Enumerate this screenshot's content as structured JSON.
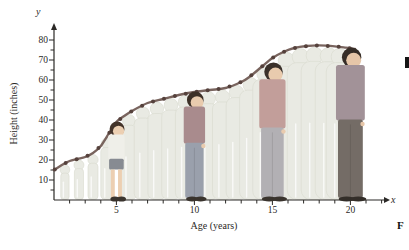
{
  "page": {
    "background": "#ffffff"
  },
  "chart_data": {
    "type": "line",
    "title": "",
    "xlabel": "Age (years)",
    "ylabel": "Height (inches)",
    "x_axis_letter": "x",
    "y_axis_letter": "y",
    "xlim": [
      1,
      22.5
    ],
    "ylim": [
      0,
      85
    ],
    "grid": false,
    "legend": "none",
    "x_ticks": {
      "labeled": [
        5,
        10,
        15,
        20
      ],
      "minor_step_years": 1,
      "minor_range": [
        2,
        22
      ]
    },
    "y_ticks": {
      "labeled": [
        10,
        20,
        30,
        40,
        50,
        60,
        70,
        80
      ],
      "minor_step_inches": 5
    },
    "series": [
      {
        "name": "height-vs-age",
        "x": [
          1,
          1.5,
          2,
          2.5,
          3,
          3.5,
          4,
          4.5,
          5,
          5.5,
          6,
          7,
          8,
          9,
          10,
          11,
          12,
          13,
          13.6,
          14.3,
          15,
          15.7,
          16.4,
          17.2,
          18,
          19,
          19.7,
          20.3
        ],
        "y": [
          15,
          17.5,
          19.5,
          20.5,
          21.5,
          23.5,
          27,
          33,
          39,
          42,
          44.5,
          48.5,
          50.5,
          52.5,
          54,
          55,
          56,
          59,
          62,
          66.5,
          71,
          74,
          76,
          77,
          77.3,
          76.8,
          76.2,
          75.5
        ]
      }
    ],
    "markers": {
      "first_age": 1.05,
      "step_years": 0.7,
      "last_age": 20.0
    },
    "colors": {
      "line": "#79645e",
      "marker": "#55413c",
      "axis": "#2b2926"
    }
  },
  "figures": {
    "ghost": {
      "color": "#e9eae3",
      "edge": "#d8dacf",
      "highlight": "#ffffff",
      "ages": [
        1.7,
        2.6,
        3.5,
        4.4,
        5.8,
        6.7,
        7.6,
        8.5,
        9.4,
        10.9,
        11.8,
        12.7,
        13.6,
        14.5,
        15.9,
        16.8,
        17.7,
        18.6,
        19.3
      ]
    },
    "people": [
      {
        "name": "boy-age-5",
        "age": 5,
        "height_in": 39,
        "style": "shorts",
        "hair": "#44342a",
        "skin": "#eccfb2",
        "shirt": "#efefe9",
        "bottoms": "#878b92",
        "shoes": "#3a342e"
      },
      {
        "name": "boy-age-10",
        "age": 10,
        "height_in": 54,
        "style": "pants",
        "hair": "#3d3027",
        "skin": "#e9cbae",
        "shirt": "#a98b8d",
        "bottoms": "#9aa0ac",
        "shoes": "#3a342e"
      },
      {
        "name": "teen-age-15",
        "age": 15,
        "height_in": 68.5,
        "style": "pants",
        "hair": "#3a302a",
        "skin": "#e9cbae",
        "shirt": "#c29e9a",
        "bottoms": "#b2b0b4",
        "shoes": "#3a342e"
      },
      {
        "name": "man-age-20",
        "age": 20,
        "height_in": 76,
        "style": "pants",
        "hair": "#362d27",
        "skin": "#e6c6a8",
        "shirt": "#a29298",
        "bottoms": "#746c66",
        "shoes": "#332e29"
      }
    ]
  },
  "annotations": {
    "caption_glyph": "F",
    "edge_bar_color": "#151515"
  }
}
